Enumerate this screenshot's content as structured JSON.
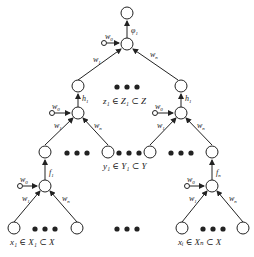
{
  "diagram": {
    "type": "hierarchical neural network tree",
    "top": {
      "activation_label": "φ",
      "activation_sub": "1",
      "bias_label": "w",
      "bias_sub": "0",
      "left_weight": "w",
      "left_weight_sub": "1",
      "right_weight": "w",
      "right_weight_sub": "n"
    },
    "middle_left": {
      "activation_label": "h",
      "activation_sub": "1",
      "bias_label": "w",
      "bias_sub": "0",
      "left_weight": "w",
      "left_weight_sub": "1",
      "right_weight": "w",
      "right_weight_sub": "n"
    },
    "middle_right": {
      "activation_label": "h",
      "activation_sub": "1",
      "bias_label": "w",
      "bias_sub": "0",
      "left_weight": "w",
      "left_weight_sub": "1",
      "right_weight": "w",
      "right_weight_sub": "n"
    },
    "bottom_left": {
      "activation_label": "f",
      "activation_sub": "1",
      "bias_label": "w",
      "bias_sub": "0",
      "left_weight": "w",
      "left_weight_sub": "1",
      "right_weight": "w",
      "right_weight_sub": "n"
    },
    "bottom_right": {
      "activation_label": "f",
      "activation_sub": "n",
      "bias_label": "w",
      "bias_sub": "0",
      "left_weight": "w",
      "left_weight_sub": "1",
      "right_weight": "w",
      "right_weight_sub": "n"
    },
    "set_labels": {
      "z": "z₁ ∈ Z₁ ⊂ Z",
      "y": "y₁ ∈ Y₁ ⊂ Y",
      "x_left": "x₁ ∈ X₁ ⊂ X",
      "x_right": "xᵢ ∈ Xₙ ⊂ X"
    },
    "ellipsis": "●●●"
  }
}
